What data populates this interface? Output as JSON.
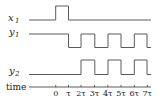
{
  "diagram": {
    "type": "timing-diagram",
    "signals": [
      {
        "name": "x",
        "subscript": "1",
        "label": "x1",
        "high_intervals": [
          [
            0,
            1
          ]
        ],
        "initial": "low"
      },
      {
        "name": "y",
        "subscript": "1",
        "label": "y1",
        "low_intervals": [
          [
            1,
            2
          ],
          [
            3,
            4
          ],
          [
            5,
            6
          ],
          [
            7,
            7.3
          ]
        ],
        "initial": "high"
      },
      {
        "name": "y",
        "subscript": "2",
        "label": "y2",
        "high_intervals": [
          [
            2,
            3
          ],
          [
            4,
            5
          ],
          [
            6,
            7
          ]
        ],
        "initial": "low"
      }
    ],
    "time_axis": {
      "label": "time",
      "ticks": [
        "0",
        "τ",
        "2τ",
        "3τ",
        "4τ",
        "5τ",
        "6τ",
        "7τ"
      ]
    }
  }
}
